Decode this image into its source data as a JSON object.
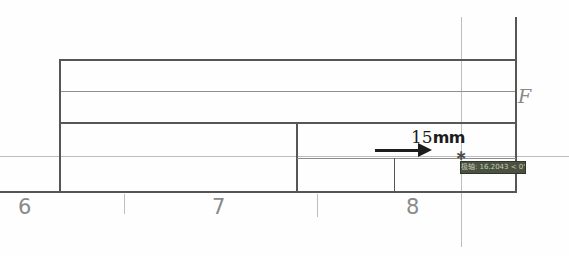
{
  "ruler": {
    "numbers": [
      "6",
      "7",
      "8"
    ]
  },
  "annotation": {
    "value": "15",
    "unit": "mm"
  },
  "section_label": "F",
  "cursor": {
    "glyph": "∗"
  },
  "tooltip": {
    "text": "极轴: 16.2043 < 0°"
  },
  "colors": {
    "background": "#fefefe",
    "line_dark": "#565656",
    "line_mid": "#8f8f8f",
    "line_light": "#bdbdbd",
    "label": "#8a8a8a",
    "annotation": "#1c1c1c",
    "tooltip_bg": "#4a5140",
    "tooltip_fg": "#c3cdb4"
  }
}
